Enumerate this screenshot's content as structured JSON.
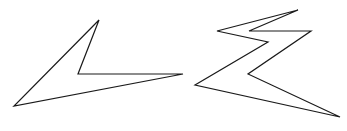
{
  "figure": {
    "background": "#ffffff",
    "stroke_color": "#1a1a1a",
    "stroke_width": 1.2,
    "shapes": [
      {
        "name": "left-polygon",
        "description": "Concave arrowhead-like quadrilateral",
        "points": "99,20 78,74 183,74 14,106"
      },
      {
        "name": "right-polygon",
        "description": "Zigzag lightning-bolt-like polygon",
        "points": "298,10 217,31 268,42 195,85 340,117 248,74 311,31 249,31"
      }
    ]
  }
}
